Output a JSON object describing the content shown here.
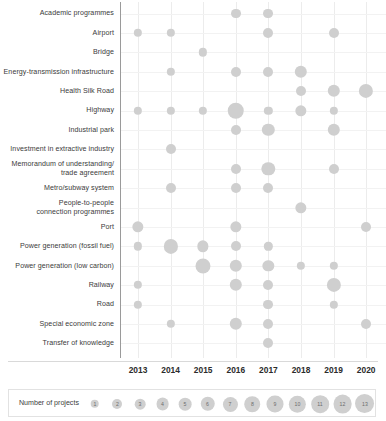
{
  "chart_data": {
    "type": "scatter",
    "title": "",
    "xlabel": "",
    "ylabel": "",
    "grid": true,
    "legend_position": "bottom",
    "legend_title": "Number of projects",
    "size_legend_values": [
      1,
      2,
      3,
      4,
      5,
      6,
      7,
      8,
      9,
      10,
      11,
      12,
      13
    ],
    "bubble_color": "#cfcfcf",
    "x": [
      "2013",
      "2014",
      "2015",
      "2016",
      "2017",
      "2018",
      "2019",
      "2020",
      "2021"
    ],
    "categories": [
      "Academic programmes",
      "Airport",
      "Bridge",
      "Energy-transmission infrastructure",
      "Health Silk Road",
      "Highway",
      "Industrial park",
      "Investment in extractive industry",
      "Memorandum of understanding/\ntrade agreement",
      "Metro/subway system",
      "People-to-people\nconnection programmes",
      "Port",
      "Power generation (fossil fuel)",
      "Power generation (low carbon)",
      "Railway",
      "Road",
      "Special economic zone",
      "Transfer of knowledge"
    ],
    "points": [
      {
        "category": "Academic programmes",
        "year": "2016",
        "value": 2
      },
      {
        "category": "Academic programmes",
        "year": "2017",
        "value": 2
      },
      {
        "category": "Airport",
        "year": "2013",
        "value": 1
      },
      {
        "category": "Airport",
        "year": "2014",
        "value": 1
      },
      {
        "category": "Airport",
        "year": "2017",
        "value": 2
      },
      {
        "category": "Airport",
        "year": "2019",
        "value": 2
      },
      {
        "category": "Bridge",
        "year": "2015",
        "value": 1
      },
      {
        "category": "Energy-transmission infrastructure",
        "year": "2014",
        "value": 1
      },
      {
        "category": "Energy-transmission infrastructure",
        "year": "2016",
        "value": 2
      },
      {
        "category": "Energy-transmission infrastructure",
        "year": "2017",
        "value": 2
      },
      {
        "category": "Energy-transmission infrastructure",
        "year": "2018",
        "value": 4
      },
      {
        "category": "Health Silk Road",
        "year": "2018",
        "value": 2
      },
      {
        "category": "Health Silk Road",
        "year": "2019",
        "value": 4
      },
      {
        "category": "Health Silk Road",
        "year": "2020",
        "value": 6
      },
      {
        "category": "Health Silk Road",
        "year": "2021",
        "value": 6
      },
      {
        "category": "Highway",
        "year": "2013",
        "value": 1
      },
      {
        "category": "Highway",
        "year": "2014",
        "value": 1
      },
      {
        "category": "Highway",
        "year": "2015",
        "value": 1
      },
      {
        "category": "Highway",
        "year": "2016",
        "value": 9
      },
      {
        "category": "Highway",
        "year": "2017",
        "value": 1
      },
      {
        "category": "Highway",
        "year": "2018",
        "value": 3
      },
      {
        "category": "Highway",
        "year": "2019",
        "value": 1
      },
      {
        "category": "Industrial park",
        "year": "2016",
        "value": 2
      },
      {
        "category": "Industrial park",
        "year": "2017",
        "value": 4
      },
      {
        "category": "Industrial park",
        "year": "2019",
        "value": 4
      },
      {
        "category": "Investment in extractive industry",
        "year": "2014",
        "value": 2
      },
      {
        "category": "Memorandum of understanding/\ntrade agreement",
        "year": "2016",
        "value": 2
      },
      {
        "category": "Memorandum of understanding/\ntrade agreement",
        "year": "2017",
        "value": 5
      },
      {
        "category": "Memorandum of understanding/\ntrade agreement",
        "year": "2019",
        "value": 2
      },
      {
        "category": "Metro/subway system",
        "year": "2014",
        "value": 2
      },
      {
        "category": "Metro/subway system",
        "year": "2016",
        "value": 2
      },
      {
        "category": "Metro/subway system",
        "year": "2017",
        "value": 2
      },
      {
        "category": "People-to-people\nconnection programmes",
        "year": "2018",
        "value": 3
      },
      {
        "category": "Port",
        "year": "2013",
        "value": 3
      },
      {
        "category": "Port",
        "year": "2016",
        "value": 3
      },
      {
        "category": "Port",
        "year": "2020",
        "value": 2
      },
      {
        "category": "Power generation (fossil fuel)",
        "year": "2013",
        "value": 1
      },
      {
        "category": "Power generation (fossil fuel)",
        "year": "2014",
        "value": 6
      },
      {
        "category": "Power generation (fossil fuel)",
        "year": "2015",
        "value": 3
      },
      {
        "category": "Power generation (fossil fuel)",
        "year": "2016",
        "value": 2
      },
      {
        "category": "Power generation (fossil fuel)",
        "year": "2017",
        "value": 1
      },
      {
        "category": "Power generation (low carbon)",
        "year": "2015",
        "value": 7
      },
      {
        "category": "Power generation (low carbon)",
        "year": "2016",
        "value": 4
      },
      {
        "category": "Power generation (low carbon)",
        "year": "2017",
        "value": 3
      },
      {
        "category": "Power generation (low carbon)",
        "year": "2018",
        "value": 1
      },
      {
        "category": "Power generation (low carbon)",
        "year": "2019",
        "value": 1
      },
      {
        "category": "Railway",
        "year": "2013",
        "value": 1
      },
      {
        "category": "Railway",
        "year": "2016",
        "value": 4
      },
      {
        "category": "Railway",
        "year": "2017",
        "value": 2
      },
      {
        "category": "Railway",
        "year": "2019",
        "value": 6
      },
      {
        "category": "Road",
        "year": "2013",
        "value": 1
      },
      {
        "category": "Road",
        "year": "2017",
        "value": 2
      },
      {
        "category": "Road",
        "year": "2019",
        "value": 1
      },
      {
        "category": "Special economic zone",
        "year": "2014",
        "value": 1
      },
      {
        "category": "Special economic zone",
        "year": "2016",
        "value": 4
      },
      {
        "category": "Special economic zone",
        "year": "2017",
        "value": 2
      },
      {
        "category": "Special economic zone",
        "year": "2020",
        "value": 2
      },
      {
        "category": "Transfer of knowledge",
        "year": "2017",
        "value": 2
      }
    ]
  }
}
